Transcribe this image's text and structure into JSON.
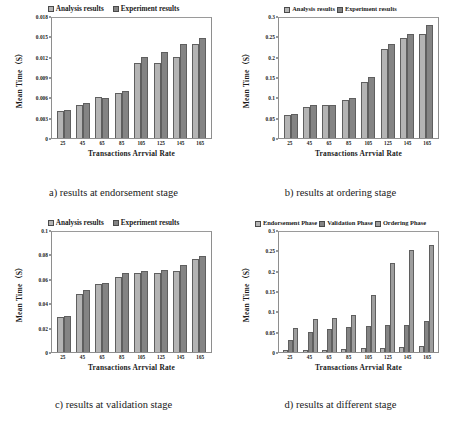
{
  "figure": {
    "panels": [
      {
        "id": "a",
        "caption": "a) results at endorsement stage",
        "legend_style": "normal",
        "chart_data": {
          "type": "bar",
          "title": "",
          "xlabel": "Transactions Arrvial Rate",
          "ylabel": "Mean Time（S）",
          "categories": [
            "25",
            "45",
            "65",
            "85",
            "105",
            "125",
            "145",
            "165"
          ],
          "ylim": [
            0,
            0.018
          ],
          "yticks": [
            0,
            0.003,
            0.006,
            0.009,
            0.012,
            0.015,
            0.018
          ],
          "ytick_labels": [
            "0",
            "0.003",
            "0.006",
            "0.009",
            "0.012",
            "0.015",
            "0.018"
          ],
          "grid": false,
          "legend_position": "top",
          "series": [
            {
              "name": "Analysis results",
              "color": "#b4b4b4",
              "values": [
                0.004,
                0.0049,
                0.006,
                0.0067,
                0.011,
                0.011,
                0.012,
                0.0139
              ]
            },
            {
              "name": "Experiment results",
              "color": "#848484",
              "values": [
                0.0042,
                0.0052,
                0.0059,
                0.007,
                0.012,
                0.0127,
                0.0139,
                0.0148
              ]
            }
          ]
        }
      },
      {
        "id": "b",
        "caption": "b) results at ordering stage",
        "legend_style": "normal",
        "chart_data": {
          "type": "bar",
          "title": "",
          "xlabel": "Transactions Arrvial Rate",
          "ylabel": "Mean Time（S）",
          "categories": [
            "25",
            "45",
            "65",
            "85",
            "105",
            "125",
            "145",
            "165"
          ],
          "ylim": [
            0,
            0.3
          ],
          "yticks": [
            0,
            0.05,
            0.1,
            0.15,
            0.2,
            0.25,
            0.3
          ],
          "ytick_labels": [
            "0",
            "0.05",
            "0.1",
            "0.15",
            "0.2",
            "0.25",
            "0.3"
          ],
          "grid": false,
          "legend_position": "top",
          "series": [
            {
              "name": "Analysis results",
              "color": "#b4b4b4",
              "values": [
                0.057,
                0.077,
                0.08,
                0.094,
                0.138,
                0.218,
                0.246,
                0.256
              ]
            },
            {
              "name": "Experiment results",
              "color": "#848484",
              "values": [
                0.06,
                0.081,
                0.082,
                0.099,
                0.149,
                0.23,
                0.257,
                0.277
              ]
            }
          ]
        }
      },
      {
        "id": "c",
        "caption": "c) results at validation stage",
        "legend_style": "normal",
        "chart_data": {
          "type": "bar",
          "title": "",
          "xlabel": "Transactions Arrvial Rate",
          "ylabel": "Mean Time（S）",
          "categories": [
            "25",
            "45",
            "65",
            "85",
            "105",
            "125",
            "145",
            "165"
          ],
          "ylim": [
            0,
            0.1
          ],
          "yticks": [
            0,
            0.02,
            0.04,
            0.06,
            0.08,
            0.1
          ],
          "ytick_labels": [
            "0",
            "0.02",
            "0.04",
            "0.06",
            "0.08",
            "0.1"
          ],
          "grid": false,
          "legend_position": "top",
          "series": [
            {
              "name": "Analysis results",
              "color": "#b4b4b4",
              "values": [
                0.0285,
                0.0475,
                0.0555,
                0.0615,
                0.0645,
                0.065,
                0.0665,
                0.0765
              ]
            },
            {
              "name": "Experiment results",
              "color": "#848484",
              "values": [
                0.0295,
                0.0505,
                0.0565,
                0.0645,
                0.0665,
                0.0675,
                0.071,
                0.0785
              ]
            }
          ]
        }
      },
      {
        "id": "d",
        "caption": "d) results at different stage",
        "legend_style": "tight",
        "chart_data": {
          "type": "bar",
          "title": "",
          "xlabel": "Transactions Arrvial Rate",
          "ylabel": "Mean Time（S）",
          "categories": [
            "25",
            "45",
            "65",
            "85",
            "105",
            "125",
            "145",
            "165"
          ],
          "ylim": [
            0,
            0.3
          ],
          "yticks": [
            0,
            0.05,
            0.1,
            0.15,
            0.2,
            0.25,
            0.3
          ],
          "ytick_labels": [
            "0",
            "0.05",
            "0.1",
            "0.15",
            "0.2",
            "0.25",
            "0.3"
          ],
          "grid": false,
          "legend_position": "top",
          "series": [
            {
              "name": "Endorsement Phase",
              "color": "#b4b4b4",
              "values": [
                0.004,
                0.005,
                0.006,
                0.007,
                0.011,
                0.011,
                0.012,
                0.014
              ]
            },
            {
              "name": "Validation Phase",
              "color": "#848484",
              "values": [
                0.029,
                0.048,
                0.056,
                0.062,
                0.065,
                0.066,
                0.067,
                0.077
              ]
            },
            {
              "name": "Ordering Phase",
              "color": "#9e9e9e",
              "values": [
                0.06,
                0.081,
                0.083,
                0.09,
                0.139,
                0.219,
                0.25,
                0.262
              ]
            }
          ]
        }
      }
    ]
  }
}
